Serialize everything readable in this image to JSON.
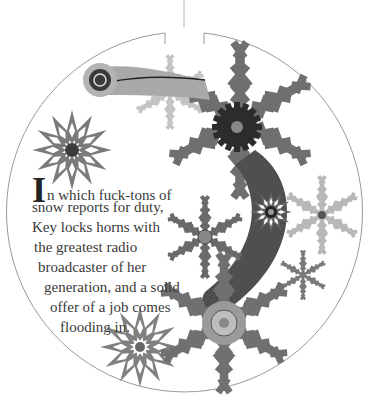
{
  "page": {
    "type": "chapter-opener",
    "illustration": {
      "description": "circular medallion with mechanical snowflakes, gears and a curved lever arm",
      "icons": [
        "snowflake-icon",
        "gear-icon",
        "lever-arm-icon"
      ],
      "colors": {
        "outline": "#9a9a9a",
        "snow_dark": "#5a5a5a",
        "snow_mid": "#7d7d7d",
        "snow_light": "#b5b5b5",
        "gear_dark": "#2c2c2c",
        "background": "#ffffff"
      }
    },
    "epigraph": {
      "drop_cap": "I",
      "lines": [
        "n which fuck-tons of",
        "snow reports for duty,",
        "Key locks horns with",
        "the greatest radio",
        "broadcaster of her",
        "generation, and a solid",
        "offer of a job comes",
        "flooding in."
      ]
    }
  }
}
